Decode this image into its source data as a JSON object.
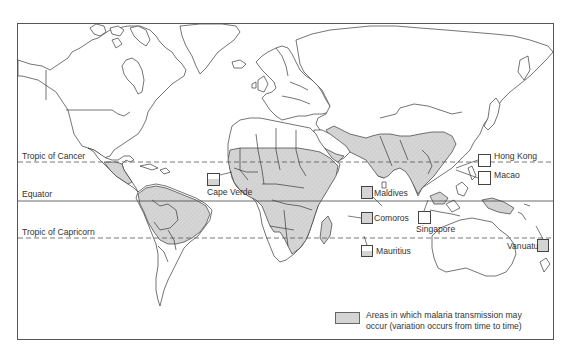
{
  "map": {
    "title": "",
    "reference_lines": {
      "tropic_of_cancer": "Tropic of Cancer",
      "equator": "Equator",
      "tropic_of_capricorn": "Tropic of Capricorn"
    },
    "callouts": [
      {
        "name": "Cape Verde",
        "fill": "partial"
      },
      {
        "name": "Maldives",
        "fill": "shaded"
      },
      {
        "name": "Comoros",
        "fill": "shaded"
      },
      {
        "name": "Mauritius",
        "fill": "partial"
      },
      {
        "name": "Singapore",
        "fill": "none"
      },
      {
        "name": "Hong Kong",
        "fill": "none"
      },
      {
        "name": "Macao",
        "fill": "none"
      },
      {
        "name": "Vanuatu",
        "fill": "shaded"
      }
    ],
    "legend": {
      "line1": "Areas in which malaria transmission may",
      "line2": "occur (variation occurs from time to time)",
      "swatch_color": "#d4d4d4"
    },
    "colors": {
      "outline": "#333333",
      "malaria_area": "#d4d4d4",
      "background": "#ffffff",
      "frame": "#555555"
    }
  }
}
